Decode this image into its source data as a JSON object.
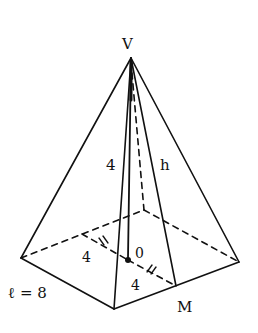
{
  "diagram": {
    "labels": {
      "apex": "V",
      "slant_edge_length": "4",
      "apothem": "h",
      "center": "0",
      "half_side_a": "4",
      "half_side_b": "4",
      "midpoint": "M",
      "side_length": "ℓ = 8"
    },
    "colors": {
      "stroke": "#111111",
      "background": "#ffffff"
    }
  }
}
